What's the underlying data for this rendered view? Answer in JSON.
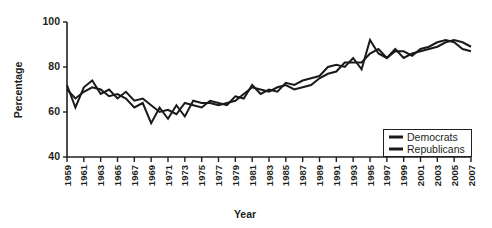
{
  "chart_data": {
    "type": "line",
    "title": "",
    "xlabel": "Year",
    "ylabel": "Percentage",
    "xlim": [
      1959,
      2007
    ],
    "ylim": [
      40,
      100
    ],
    "yticks": [
      40,
      60,
      80,
      100
    ],
    "grid": false,
    "legend_position": "bottom-right",
    "x": [
      1959,
      1960,
      1961,
      1962,
      1963,
      1964,
      1965,
      1966,
      1967,
      1968,
      1969,
      1970,
      1971,
      1972,
      1973,
      1974,
      1975,
      1976,
      1977,
      1978,
      1979,
      1980,
      1981,
      1982,
      1983,
      1984,
      1985,
      1986,
      1987,
      1988,
      1989,
      1990,
      1991,
      1992,
      1993,
      1994,
      1995,
      1996,
      1997,
      1998,
      1999,
      2000,
      2001,
      2002,
      2003,
      2004,
      2005,
      2006,
      2007
    ],
    "xtick_labels": [
      "1959",
      "1961",
      "1963",
      "1965",
      "1967",
      "1969",
      "1971",
      "1973",
      "1975",
      "1977",
      "1979",
      "1981",
      "1983",
      "1985",
      "1987",
      "1989",
      "1991",
      "1993",
      "1995",
      "1997",
      "1999",
      "2001",
      "2003",
      "2005",
      "2007"
    ],
    "series": [
      {
        "name": "Democrats",
        "color": "#1a1a1a",
        "values": [
          72,
          62,
          71,
          74,
          68,
          70,
          66,
          69,
          65,
          66,
          63,
          60,
          61,
          59,
          64,
          63,
          62,
          65,
          64,
          63,
          67,
          66,
          72,
          68,
          70,
          69,
          73,
          72,
          74,
          75,
          76,
          80,
          81,
          80,
          84,
          79,
          92,
          86,
          84,
          87,
          87,
          85,
          88,
          89,
          91,
          92,
          91,
          88,
          87
        ]
      },
      {
        "name": "Republicans",
        "color": "#1a1a1a",
        "values": [
          70,
          66,
          69,
          71,
          70,
          67,
          68,
          66,
          62,
          64,
          55,
          62,
          57,
          63,
          58,
          65,
          64,
          64,
          63,
          64,
          65,
          68,
          71,
          70,
          69,
          71,
          72,
          70,
          71,
          72,
          75,
          77,
          78,
          82,
          82,
          82,
          86,
          88,
          84,
          88,
          84,
          86,
          87,
          88,
          89,
          91,
          92,
          91,
          89
        ]
      }
    ],
    "legend": [
      {
        "label": "Democrats"
      },
      {
        "label": "Republicans"
      }
    ]
  }
}
